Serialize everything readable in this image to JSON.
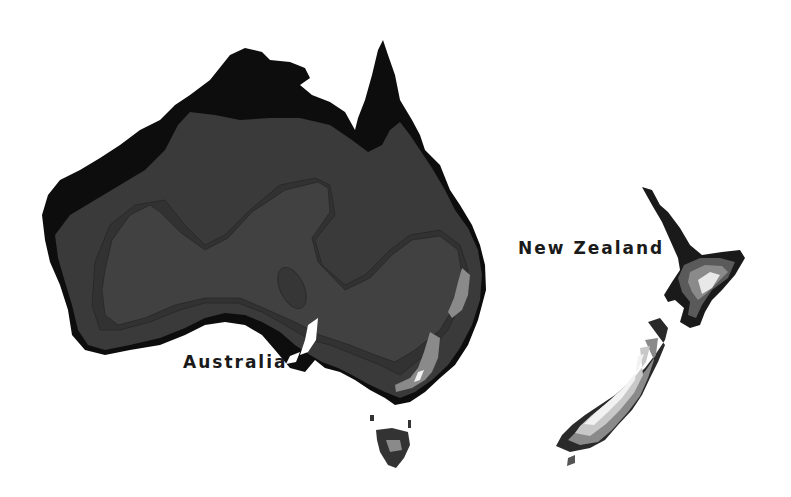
{
  "map": {
    "labels": {
      "australia": "Australia",
      "new_zealand": "New Zealand"
    },
    "colors": {
      "background": "#ffffff",
      "coastal_zone": "#0d0d0d",
      "zone_dark": "#333333",
      "zone_mid": "#3d3d3d",
      "zone_inner": "#454545",
      "highland": "#8a8a8a",
      "alpine": "#c8c8c8",
      "snow": "#f2f2f2",
      "label_text": "#1a1a1a"
    }
  }
}
